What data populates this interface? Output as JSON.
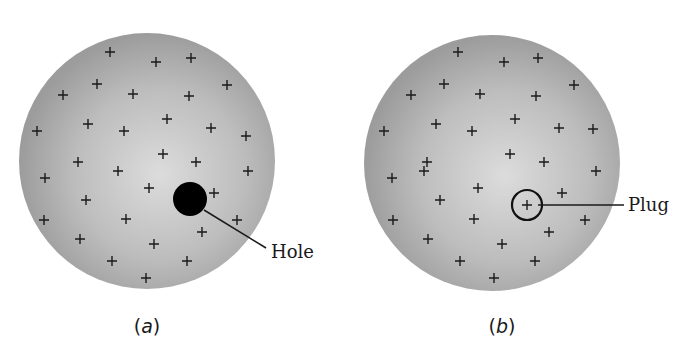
{
  "figure": {
    "panels": [
      {
        "id": "a",
        "caption_letter": "a",
        "description": "Uniformly charged sphere with a hole",
        "feature": "hole",
        "feature_label": "Hole",
        "colors": {
          "sphere_center": "#d9d9d9",
          "sphere_edge": "#9e9e9e",
          "feature": "#000000"
        },
        "charge_symbol": "+",
        "charge_count": 32
      },
      {
        "id": "b",
        "caption_letter": "b",
        "description": "Uniformly charged sphere with the plug in place",
        "feature": "plug",
        "feature_label": "Plug",
        "colors": {
          "sphere_center": "#d9d9d9",
          "sphere_edge": "#9e9e9e",
          "feature": "#000000"
        },
        "charge_symbol": "+",
        "charge_count": 33
      }
    ]
  }
}
